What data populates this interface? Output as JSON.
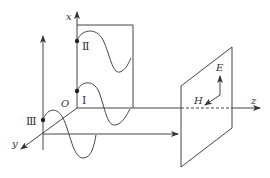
{
  "diagram": {
    "labels": {
      "x_axis": "x",
      "y_axis": "y",
      "z_axis": "z",
      "origin": "O",
      "wave_1": "Ⅰ",
      "wave_2": "Ⅱ",
      "wave_3": "Ⅲ",
      "E_field": "E",
      "H_field": "H"
    },
    "colors": {
      "line": "#444444",
      "background": "#ffffff"
    }
  }
}
